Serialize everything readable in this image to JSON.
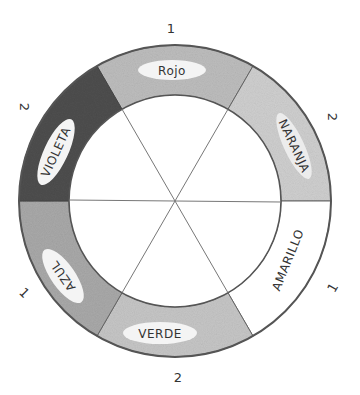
{
  "wheel": {
    "center": [
      175,
      201
    ],
    "outer_radius": 156,
    "inner_radius": 106,
    "segments": [
      {
        "name": "rojo",
        "label": "Rojo",
        "start_deg": 60,
        "end_deg": 120,
        "fill": "#bdbdbd",
        "number": "1"
      },
      {
        "name": "naranja",
        "label": "NARANJA",
        "start_deg": 0,
        "end_deg": 60,
        "fill": "#cfcfcf",
        "number": "2"
      },
      {
        "name": "amarillo",
        "label": "AMARILLO",
        "start_deg": -60,
        "end_deg": 0,
        "fill": "#ffffff",
        "number": "1"
      },
      {
        "name": "verde",
        "label": "VERDE",
        "start_deg": -120,
        "end_deg": -60,
        "fill": "#c6c6c6",
        "number": "2"
      },
      {
        "name": "azul",
        "label": "AZUL",
        "start_deg": 180,
        "end_deg": 240,
        "fill": "#a9a9a9",
        "number": "1"
      },
      {
        "name": "violeta",
        "label": "VIOLETA",
        "start_deg": 120,
        "end_deg": 180,
        "fill": "#4e4e4e",
        "number": "2"
      }
    ]
  },
  "numbers": {
    "top": "1",
    "upper_right": "2",
    "lower_right": "1",
    "bottom": "2",
    "lower_left": "1",
    "upper_left": "2"
  },
  "labels": {
    "rojo": "Rojo",
    "naranja": "NARANJA",
    "amarillo": "AMARILLO",
    "verde": "VERDE",
    "azul": "AZUL",
    "violeta": "VIOLETA"
  },
  "colors": {
    "stroke": "#555555",
    "inner_line": "#777777",
    "label_bg": "#f4f4f4"
  }
}
